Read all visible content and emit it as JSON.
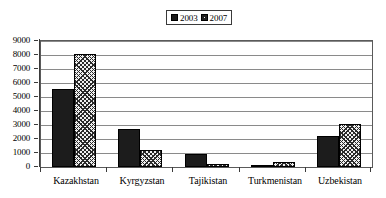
{
  "chart_data": {
    "type": "bar",
    "title": "",
    "subtitle": "",
    "xlabel": "",
    "ylabel": "",
    "categories": [
      "Kazakhstan",
      "Kyrgyzstan",
      "Tajikistan",
      "Turkmenistan",
      "Uzbekistan"
    ],
    "series": [
      {
        "name": "2003",
        "style": "solid-black",
        "values": [
          5550,
          2700,
          950,
          150,
          2200
        ]
      },
      {
        "name": "2007",
        "style": "cross-hatch",
        "values": [
          8100,
          1250,
          220,
          330,
          3050
        ]
      }
    ],
    "ylim": [
      0,
      9000
    ],
    "ytick_step": 1000,
    "yticks": [
      9000,
      8000,
      7000,
      6000,
      5000,
      4000,
      3000,
      2000,
      1000,
      0
    ],
    "ytick_labels": [
      "9000",
      "8000",
      "7000",
      "6000",
      "5000",
      "4000",
      "3000",
      "2000",
      "1000",
      "0"
    ],
    "grid": true,
    "grid_axis": "y",
    "legend_position": "top-center",
    "legend_entries": [
      "2003",
      "2007"
    ],
    "colors": {
      "series_2003": "#1c1c1c",
      "series_2007_fill": "#f0f0f0",
      "series_2007_hatch": "#2a2a2a",
      "gridline": "#8a8a8a",
      "axis": "#3a3a3a",
      "plot_background": "#ffffff",
      "text": "#000000"
    }
  },
  "legend": {
    "entries": [
      {
        "label": "2003",
        "swatch": "solid-swatch"
      },
      {
        "label": "2007",
        "swatch": "hatched-swatch"
      }
    ]
  }
}
